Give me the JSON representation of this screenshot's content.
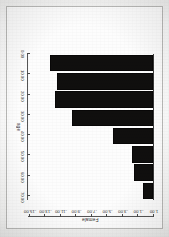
{
  "figure": {
    "kind": "scanned-bar-chart",
    "orientation_note": "printed upside down",
    "background_color": "#fbfbfa",
    "bar_color": "#100f0e",
    "axis_color": "#555555"
  },
  "chart_data": {
    "type": "bar",
    "orientation": "horizontal",
    "title": "",
    "xlabel": "age",
    "ylabel": "Female",
    "grid": false,
    "legend": null,
    "categories": [
      "1.00",
      "-1.00",
      "-3.00",
      "-5.00",
      "-7.00",
      "-9.00",
      "-11.00",
      "-13.00"
    ],
    "category_tick_labels": [
      "1.00",
      "-1.00",
      "-3.00",
      "-5.00",
      "-7.00",
      "-9.00",
      "-11.00",
      "-13.00",
      "-15.00"
    ],
    "values": [
      6.0,
      11.0,
      12.0,
      23.0,
      47.0,
      57.0,
      56.0,
      60.0
    ],
    "value_tick_labels": [
      "0.00",
      "10.00",
      "20.00",
      "30.00",
      "40.00",
      "50.00",
      "60.00",
      "70.00"
    ],
    "value_ticks": [
      0,
      10,
      20,
      30,
      40,
      50,
      60,
      70
    ],
    "xlim": [
      0,
      72
    ],
    "ylim": [
      -15,
      1
    ]
  }
}
